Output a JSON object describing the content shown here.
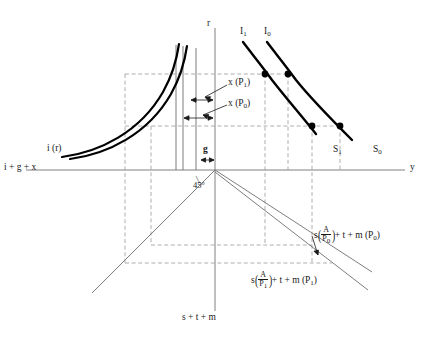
{
  "figure": {
    "type": "four-quadrant-macroeconomic-diagram",
    "width": 431,
    "height": 341,
    "background": "#ffffff",
    "colors": {
      "curve_bold": "#000000",
      "axis": "#808080",
      "dashed_guide": "#9a9a9a",
      "thin_line": "#6e6e6e",
      "text": "#1a1a1a"
    }
  },
  "axes": {
    "vertical_top_label": "r",
    "vertical_bottom_label": "s + t + m",
    "horizontal_right_label": "y",
    "horizontal_left_label": "i + g + x",
    "angle_label": "45°",
    "origin": {
      "x": 215,
      "y": 170
    }
  },
  "curves": {
    "investment": {
      "label": "i (r)",
      "description": "two parallel convex decreasing investment schedules in upper-left quadrant"
    },
    "is_curves": [
      {
        "name": "I1",
        "label": "I",
        "sub": "1",
        "top_label_x": 244,
        "top_label_y": 32
      },
      {
        "name": "I0",
        "label": "I",
        "sub": "0",
        "top_label_x": 268,
        "top_label_y": 32
      }
    ],
    "saving_curves": [
      {
        "name": "S1",
        "label": "S",
        "sub": "1",
        "end_label_x": 336,
        "end_label_y": 150
      },
      {
        "name": "S0",
        "label": "S",
        "sub": "0",
        "end_label_x": 375,
        "end_label_y": 150
      }
    ]
  },
  "annotations": {
    "x_p1": {
      "text": "x (P",
      "sub": "1",
      "close": ")"
    },
    "x_p0": {
      "text": "x (P",
      "sub": "0",
      "close": ")"
    },
    "g": "g"
  },
  "equations": {
    "p0": {
      "prefix": "s",
      "numerator": "A",
      "denominator": "P",
      "denominator_sub": "0",
      "suffix": "+ t + m (P",
      "suffix_sub": "0",
      "suffix_close": ")"
    },
    "p1": {
      "prefix": "s",
      "numerator": "A",
      "denominator": "P",
      "denominator_sub": "1",
      "suffix": "+ t + m (P",
      "suffix_sub": "1",
      "suffix_close": ")"
    }
  },
  "intersection_points": [
    {
      "name": "upper-I1",
      "x": 265,
      "y": 74
    },
    {
      "name": "upper-I0",
      "x": 288,
      "y": 74
    },
    {
      "name": "lower-I1",
      "x": 312,
      "y": 126
    },
    {
      "name": "lower-I0",
      "x": 340,
      "y": 126
    }
  ]
}
